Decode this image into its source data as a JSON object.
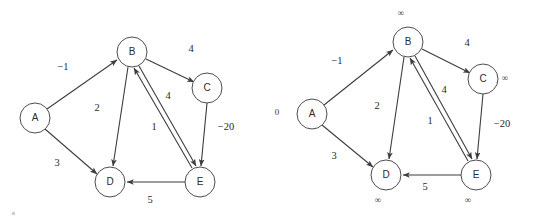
{
  "figure": {
    "type": "graph-diagram",
    "colors": {
      "background": "#ffffff",
      "node_stroke": "#4d4d4d",
      "node_fill": "#ffffff",
      "edge_stroke": "#3d3d3d",
      "text": "#2b2b2b"
    }
  },
  "panels": [
    {
      "id": "left-graph",
      "name": "weighted-directed-graph",
      "nodes": [
        {
          "id": "A",
          "label": "A",
          "cx": 35,
          "cy": 118,
          "r": 15
        },
        {
          "id": "B",
          "label": "B",
          "cx": 132,
          "cy": 52,
          "r": 15
        },
        {
          "id": "C",
          "label": "C",
          "cx": 207,
          "cy": 88,
          "r": 15
        },
        {
          "id": "D",
          "label": "D",
          "cx": 110,
          "cy": 182,
          "r": 15
        },
        {
          "id": "E",
          "label": "E",
          "cx": 200,
          "cy": 182,
          "r": 15
        }
      ],
      "edges": [
        {
          "from": "A",
          "to": "B",
          "weight": "−1",
          "lx": 63,
          "ly": 68
        },
        {
          "from": "A",
          "to": "D",
          "weight": "3",
          "lx": 57,
          "ly": 164
        },
        {
          "from": "B",
          "to": "C",
          "weight": "4",
          "lx": 191,
          "ly": 50
        },
        {
          "from": "B",
          "to": "D",
          "weight": "2",
          "lx": 97,
          "ly": 109
        },
        {
          "from": "B",
          "to": "E",
          "weight": "4",
          "lx": 168,
          "ly": 97
        },
        {
          "from": "E",
          "to": "B",
          "weight": "1",
          "lx": 154,
          "ly": 128
        },
        {
          "from": "C",
          "to": "E",
          "weight": "−20",
          "lx": 226,
          "ly": 128
        },
        {
          "from": "E",
          "to": "D",
          "weight": "5",
          "lx": 150,
          "ly": 201
        }
      ],
      "distances": []
    },
    {
      "id": "right-graph",
      "name": "weighted-directed-graph-with-distances",
      "nodes": [
        {
          "id": "A",
          "label": "A",
          "cx": 312,
          "cy": 114,
          "r": 15
        },
        {
          "id": "B",
          "label": "B",
          "cx": 408,
          "cy": 42,
          "r": 15
        },
        {
          "id": "C",
          "label": "C",
          "cx": 483,
          "cy": 79,
          "r": 15
        },
        {
          "id": "D",
          "label": "D",
          "cx": 386,
          "cy": 175,
          "r": 15
        },
        {
          "id": "E",
          "label": "E",
          "cx": 476,
          "cy": 175,
          "r": 15
        }
      ],
      "edges": [
        {
          "from": "A",
          "to": "B",
          "weight": "−1",
          "lx": 337,
          "ly": 62
        },
        {
          "from": "A",
          "to": "D",
          "weight": "3",
          "lx": 334,
          "ly": 157
        },
        {
          "from": "B",
          "to": "C",
          "weight": "4",
          "lx": 467,
          "ly": 44
        },
        {
          "from": "B",
          "to": "D",
          "weight": "2",
          "lx": 377,
          "ly": 107
        },
        {
          "from": "B",
          "to": "E",
          "weight": "4",
          "lx": 444,
          "ly": 91
        },
        {
          "from": "E",
          "to": "B",
          "weight": "1",
          "lx": 430,
          "ly": 122
        },
        {
          "from": "C",
          "to": "E",
          "weight": "−20",
          "lx": 502,
          "ly": 125
        },
        {
          "from": "E",
          "to": "D",
          "weight": "5",
          "lx": 425,
          "ly": 188
        }
      ],
      "distances": [
        {
          "node": "A",
          "value": "0",
          "lx": 277,
          "ly": 113
        },
        {
          "node": "B",
          "value": "∞",
          "lx": 401,
          "ly": 14
        },
        {
          "node": "C",
          "value": "∞",
          "lx": 505,
          "ly": 79
        },
        {
          "node": "D",
          "value": "∞",
          "lx": 378,
          "ly": 201
        },
        {
          "node": "E",
          "value": "∞",
          "lx": 468,
          "ly": 201
        }
      ]
    }
  ]
}
